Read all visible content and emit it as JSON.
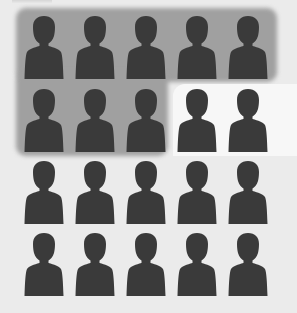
{
  "chart_data": {
    "type": "icon-array",
    "title": "",
    "rows": 4,
    "columns": 5,
    "total": 20,
    "highlighted": 8,
    "not_highlighted": 12,
    "highlight_fraction": 0.4,
    "icon": "person-silhouette-icon",
    "colors": {
      "page_background": "#ebebeb",
      "highlight_background": "#a0a0a0",
      "icon_fill": "#3a3a3a",
      "unhighlighted_pocket": "#f7f7f7"
    },
    "layout": {
      "column_centers_x": [
        44,
        95,
        146,
        197,
        248
      ],
      "row_tops_y": [
        15,
        88,
        160,
        232
      ]
    },
    "cells": [
      {
        "row": 1,
        "col": 1,
        "highlighted": true
      },
      {
        "row": 1,
        "col": 2,
        "highlighted": true
      },
      {
        "row": 1,
        "col": 3,
        "highlighted": true
      },
      {
        "row": 1,
        "col": 4,
        "highlighted": true
      },
      {
        "row": 1,
        "col": 5,
        "highlighted": true
      },
      {
        "row": 2,
        "col": 1,
        "highlighted": true
      },
      {
        "row": 2,
        "col": 2,
        "highlighted": true
      },
      {
        "row": 2,
        "col": 3,
        "highlighted": true
      },
      {
        "row": 2,
        "col": 4,
        "highlighted": false
      },
      {
        "row": 2,
        "col": 5,
        "highlighted": false
      },
      {
        "row": 3,
        "col": 1,
        "highlighted": false
      },
      {
        "row": 3,
        "col": 2,
        "highlighted": false
      },
      {
        "row": 3,
        "col": 3,
        "highlighted": false
      },
      {
        "row": 3,
        "col": 4,
        "highlighted": false
      },
      {
        "row": 3,
        "col": 5,
        "highlighted": false
      },
      {
        "row": 4,
        "col": 1,
        "highlighted": false
      },
      {
        "row": 4,
        "col": 2,
        "highlighted": false
      },
      {
        "row": 4,
        "col": 3,
        "highlighted": false
      },
      {
        "row": 4,
        "col": 4,
        "highlighted": false
      },
      {
        "row": 4,
        "col": 5,
        "highlighted": false
      }
    ]
  }
}
